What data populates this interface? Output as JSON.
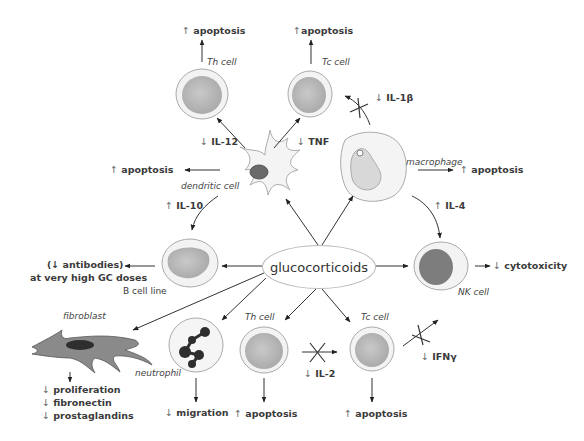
{
  "center": {
    "label": "glucocorticoids"
  },
  "cells": {
    "th_top": "Th cell",
    "tc_top": "Tc cell",
    "dendritic": "dendritic cell",
    "macrophage": "macrophage",
    "b_cell": "B cell line",
    "nk": "NK cell",
    "fibroblast": "fibroblast",
    "neutrophil": "neutrophil",
    "th_bottom": "Th cell",
    "tc_bottom": "Tc cell"
  },
  "effects": {
    "th_top_apoptosis": {
      "arrow": "↑",
      "text": "apoptosis"
    },
    "tc_top_apoptosis": {
      "arrow": "↑",
      "text": "apoptosis"
    },
    "il12": {
      "arrow": "↓",
      "text": "IL-12"
    },
    "tnf": {
      "arrow": "↓",
      "text": "TNF"
    },
    "il1b": {
      "arrow": "↓",
      "text": "IL-1β"
    },
    "dendritic_apoptosis": {
      "arrow": "↑",
      "text": "apoptosis"
    },
    "macrophage_apoptosis": {
      "arrow": "↑",
      "text": "apoptosis"
    },
    "il10": {
      "arrow": "↑",
      "text": "IL-10"
    },
    "il4": {
      "arrow": "↑",
      "text": "IL-4"
    },
    "antibodies_line1": "(↓ antibodies)",
    "antibodies_line2": "at very high GC doses",
    "cytotoxicity": {
      "arrow": "↓",
      "text": "cytotoxicity"
    },
    "fibroblast_effects": [
      {
        "arrow": "↓",
        "text": "proliferation"
      },
      {
        "arrow": "↓",
        "text": "fibronectin"
      },
      {
        "arrow": "↓",
        "text": "prostaglandins"
      }
    ],
    "migration": {
      "arrow": "↓",
      "text": "migration"
    },
    "th_bottom_apoptosis": {
      "arrow": "↑",
      "text": "apoptosis"
    },
    "tc_bottom_apoptosis": {
      "arrow": "↑",
      "text": "apoptosis"
    },
    "il2": {
      "arrow": "↓",
      "text": "IL-2"
    },
    "ifng": {
      "arrow": "↓",
      "text": "IFNγ"
    }
  },
  "colors": {
    "cell_fill": "#bdbdbd",
    "cell_ring": "#e4e4e4",
    "nk_nucleus": "#7d7d7d",
    "neutrophil_nucleus": "#2e2e2e",
    "line": "#333333",
    "ellipse_border": "#b9b9b9"
  }
}
